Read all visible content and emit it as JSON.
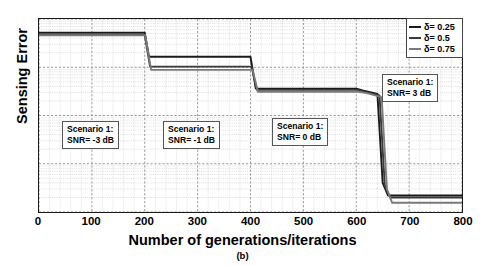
{
  "chart_data": {
    "type": "line",
    "title": "",
    "subcaption": "(b)",
    "xlabel": "Number of generations/iterations",
    "ylabel": "Sensing Error",
    "xlim": [
      0,
      800
    ],
    "ylim": [
      1e-05,
      0.1
    ],
    "yscale": "log",
    "grid": true,
    "legend_position": "top-right",
    "xticks": [
      0,
      100,
      200,
      300,
      400,
      500,
      600,
      700,
      800
    ],
    "xtick_labels": [
      "0",
      "100",
      "200",
      "300",
      "400",
      "500",
      "600",
      "700",
      "800"
    ],
    "ytick_labels": [
      "10-1",
      "10-2",
      "10-3",
      "10-4",
      "10-5"
    ],
    "ytick_values": [
      0.1,
      0.01,
      0.001,
      0.0001,
      1e-05
    ],
    "series": [
      {
        "name": "d= 0.25",
        "color": "#1a1a1a",
        "x": [
          0,
          195,
          200,
          208,
          396,
          400,
          410,
          596,
          600,
          612,
          640,
          650,
          660,
          800
        ],
        "y": [
          0.052,
          0.052,
          0.052,
          0.0165,
          0.0165,
          0.0165,
          0.0036,
          0.0036,
          0.0036,
          0.0033,
          0.0028,
          4e-05,
          2.2e-05,
          2.2e-05
        ]
      },
      {
        "name": "d= 0.5",
        "color": "#3a3a3a",
        "x": [
          0,
          196,
          200,
          210,
          398,
          402,
          412,
          598,
          602,
          616,
          644,
          654,
          664,
          800
        ],
        "y": [
          0.047,
          0.047,
          0.047,
          0.0103,
          0.0103,
          0.0103,
          0.0034,
          0.0034,
          0.0034,
          0.0031,
          0.0026,
          3.5e-05,
          2e-05,
          2e-05
        ]
      },
      {
        "name": "d= 0.75",
        "color": "#7a7a7a",
        "x": [
          0,
          197,
          201,
          212,
          399,
          404,
          414,
          599,
          604,
          620,
          648,
          658,
          668,
          800
        ],
        "y": [
          0.046,
          0.046,
          0.046,
          0.0088,
          0.0088,
          0.0088,
          0.0031,
          0.0031,
          0.0031,
          0.0029,
          0.0024,
          3e-05,
          1.55e-05,
          1.55e-05
        ]
      }
    ],
    "legend": [
      {
        "label": "δ= 0.25",
        "color": "#1a1a1a"
      },
      {
        "label": "δ= 0.5",
        "color": "#3a3a3a"
      },
      {
        "label": "δ= 0.75",
        "color": "#7a7a7a"
      }
    ],
    "annotations": [
      {
        "line1": "Scenario 1:",
        "line2": "SNR= -3 dB",
        "x": 62,
        "y": 121
      },
      {
        "line1": "Scenario 1:",
        "line2": "SNR= -1 dB",
        "x": 163,
        "y": 121
      },
      {
        "line1": "Scenario 1:",
        "line2": "SNR= 0 dB",
        "x": 272,
        "y": 118
      },
      {
        "line1": "Scenario 1:",
        "line2": "SNR= 3 dB",
        "x": 382,
        "y": 74
      }
    ]
  },
  "axis": {
    "ylabel": "Sensing Error",
    "xlabel": "Number of generations/iterations",
    "subcaption": "(b)",
    "yticks": [
      {
        "mantissa": "10",
        "exp": "-1"
      },
      {
        "mantissa": "10",
        "exp": "-2"
      },
      {
        "mantissa": "10",
        "exp": "-3"
      },
      {
        "mantissa": "10",
        "exp": "-4"
      },
      {
        "mantissa": "10",
        "exp": "-5"
      }
    ]
  },
  "colors": {
    "frame": "#1a1a1a",
    "grid_major": "#8c8c8c",
    "grid_minor": "#c4c4c4",
    "background": "#ffffff"
  }
}
